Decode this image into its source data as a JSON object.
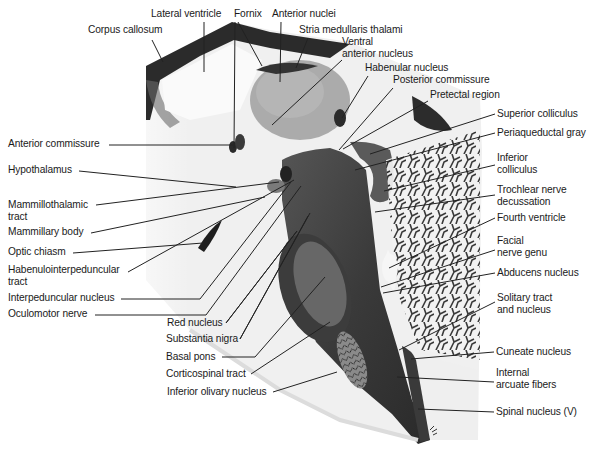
{
  "figure": {
    "type": "annotated sagittal section of brainstem and diencephalon",
    "colors": {
      "tissue_dark": "#2e2e2e",
      "tissue_mid": "#777777",
      "tissue_light": "#e6e6e6",
      "leader": "#222222",
      "text": "#1a1a1a"
    },
    "labels": [
      {
        "id": "lateral-ventricle",
        "text": "Lateral ventricle",
        "x": 151,
        "y": 8,
        "lx": 204,
        "ly": 22,
        "tx": 204,
        "ty": 72
      },
      {
        "id": "corpus-callosum",
        "text": "Corpus callosum",
        "x": 88,
        "y": 24,
        "lx": 152,
        "ly": 40,
        "tx": 163,
        "ty": 62
      },
      {
        "id": "fornix",
        "text": "Fornix",
        "x": 234,
        "y": 8,
        "lx": 235,
        "ly": 22,
        "tx": 234,
        "ty": 148
      },
      {
        "id": "fornix-2",
        "text": "",
        "x": 0,
        "y": 0,
        "lx": 238,
        "ly": 22,
        "tx": 262,
        "ty": 66
      },
      {
        "id": "anterior-nuclei",
        "text": "Anterior nuclei",
        "x": 272,
        "y": 8,
        "lx": 281,
        "ly": 22,
        "tx": 280,
        "ty": 82
      },
      {
        "id": "stria-medullaris-thalami",
        "text": "Stria medullaris thalami",
        "x": 299,
        "y": 24,
        "lx": 308,
        "ly": 38,
        "tx": 296,
        "ty": 68
      },
      {
        "id": "ventral-anterior-nucleus",
        "text": "Ventral\nanterior nucleus",
        "x": 342,
        "y": 36,
        "lx": 342,
        "ly": 60,
        "tx": 272,
        "ty": 125
      },
      {
        "id": "habenular-nucleus",
        "text": "Habenular nucleus",
        "x": 365,
        "y": 62,
        "lx": 368,
        "ly": 76,
        "tx": 342,
        "ty": 118
      },
      {
        "id": "posterior-commissure",
        "text": "Posterior commissure",
        "x": 393,
        "y": 74,
        "lx": 393,
        "ly": 88,
        "tx": 339,
        "ty": 150
      },
      {
        "id": "pretectal-region",
        "text": "Pretectal region",
        "x": 430,
        "y": 89,
        "lx": 428,
        "ly": 101,
        "tx": 343,
        "ty": 149
      },
      {
        "id": "superior-colliculus",
        "text": "Superior colliculus",
        "x": 497,
        "y": 108,
        "lx": 495,
        "ly": 114,
        "tx": 370,
        "ty": 154
      },
      {
        "id": "periaqueductal-gray",
        "text": "Periaqueductal gray",
        "x": 497,
        "y": 127,
        "lx": 495,
        "ly": 133,
        "tx": 355,
        "ty": 170
      },
      {
        "id": "inferior-colliculus",
        "text": "Inferior\ncolliculus",
        "x": 497,
        "y": 152,
        "lx": 495,
        "ly": 165,
        "tx": 384,
        "ty": 191
      },
      {
        "id": "trochlear-nerve-decussation",
        "text": "Trochlear nerve\ndecussation",
        "x": 497,
        "y": 184,
        "lx": 495,
        "ly": 195,
        "tx": 375,
        "ty": 212
      },
      {
        "id": "fourth-ventricle",
        "text": "Fourth ventricle",
        "x": 497,
        "y": 212,
        "lx": 495,
        "ly": 218,
        "tx": 389,
        "ty": 268
      },
      {
        "id": "facial-nerve-genu",
        "text": "Facial\nnerve genu",
        "x": 497,
        "y": 235,
        "lx": 495,
        "ly": 250,
        "tx": 381,
        "ty": 287
      },
      {
        "id": "abducens-nucleus",
        "text": "Abducens nucleus",
        "x": 497,
        "y": 267,
        "lx": 495,
        "ly": 273,
        "tx": 383,
        "ty": 293
      },
      {
        "id": "solitary-tract-and-nucleus",
        "text": "Solitary tract\nand nucleus",
        "x": 497,
        "y": 292,
        "lx": 495,
        "ly": 302,
        "tx": 399,
        "ty": 350
      },
      {
        "id": "cuneate-nucleus",
        "text": "Cuneate nucleus",
        "x": 496,
        "y": 346,
        "lx": 494,
        "ly": 352,
        "tx": 411,
        "ty": 359
      },
      {
        "id": "internal-arcuate-fibers",
        "text": "Internal\narcuate fibers",
        "x": 496,
        "y": 367,
        "lx": 494,
        "ly": 382,
        "tx": 397,
        "ty": 377
      },
      {
        "id": "spinal-nucleus-v",
        "text": "Spinal nucleus (V)",
        "x": 496,
        "y": 406,
        "lx": 494,
        "ly": 412,
        "tx": 418,
        "ty": 409
      },
      {
        "id": "anterior-commissure",
        "text": "Anterior commissure",
        "x": 8,
        "y": 138,
        "lx": 109,
        "ly": 145,
        "tx": 233,
        "ty": 145
      },
      {
        "id": "hypothalamus",
        "text": "Hypothalamus",
        "x": 8,
        "y": 164,
        "lx": 79,
        "ly": 171,
        "tx": 236,
        "ty": 187
      },
      {
        "id": "mammillothalamic-tract",
        "text": "Mammillothalamic\ntract",
        "x": 8,
        "y": 199,
        "lx": 96,
        "ly": 205,
        "tx": 279,
        "ty": 182
      },
      {
        "id": "mammillary-body",
        "text": "Mammillary body",
        "x": 8,
        "y": 226,
        "lx": 91,
        "ly": 233,
        "tx": 265,
        "ty": 197
      },
      {
        "id": "optic-chiasm",
        "text": "Optic chiasm",
        "x": 8,
        "y": 246,
        "lx": 73,
        "ly": 253,
        "tx": 203,
        "ty": 243
      },
      {
        "id": "habenulointerpeduncular-tract",
        "text": "Habenulointerpeduncular\ntract",
        "x": 8,
        "y": 264,
        "lx": 128,
        "ly": 272,
        "tx": 294,
        "ty": 180
      },
      {
        "id": "interpeduncular-nucleus",
        "text": "Interpeduncular nucleus",
        "x": 8,
        "y": 292,
        "lx": 121,
        "ly": 299,
        "tx": 200,
        "ty": 299
      },
      {
        "id": "oculomotor-nerve",
        "text": "Oculomotor nerve",
        "x": 8,
        "y": 308,
        "lx": 95,
        "ly": 315,
        "tx": 206,
        "ty": 315
      },
      {
        "id": "red-nucleus",
        "text": "Red nucleus",
        "x": 167,
        "y": 317,
        "lx": 226,
        "ly": 323,
        "tx": 297,
        "ty": 231
      },
      {
        "id": "substantia-nigra",
        "text": "Substantia nigra",
        "x": 166,
        "y": 333,
        "lx": 240,
        "ly": 339,
        "tx": 308,
        "ty": 216
      },
      {
        "id": "basal-pons",
        "text": "Basal pons",
        "x": 166,
        "y": 351,
        "lx": 222,
        "ly": 357,
        "tx": 255,
        "ty": 357
      },
      {
        "id": "corticospinal-tract",
        "text": "Corticospinal tract",
        "x": 166,
        "y": 368,
        "lx": 251,
        "ly": 374,
        "tx": 330,
        "ty": 322
      },
      {
        "id": "inferior-olivary-nucleus",
        "text": "Inferior olivary nucleus",
        "x": 167,
        "y": 386,
        "lx": 273,
        "ly": 392,
        "tx": 337,
        "ty": 372
      }
    ],
    "extra_segments": [
      {
        "id": "basal-pons-seg",
        "x1": 255,
        "y1": 357,
        "x2": 325,
        "y2": 277
      },
      {
        "id": "interpeduncular-seg",
        "x1": 200,
        "y1": 299,
        "x2": 291,
        "y2": 182
      },
      {
        "id": "oculomotor-seg",
        "x1": 206,
        "y1": 315,
        "x2": 301,
        "y2": 186
      },
      {
        "id": "red-seg",
        "x1": 226,
        "y1": 323,
        "x2": 297,
        "y2": 231
      },
      {
        "id": "substantia-seg",
        "x1": 240,
        "y1": 339,
        "x2": 310,
        "y2": 213
      }
    ]
  }
}
